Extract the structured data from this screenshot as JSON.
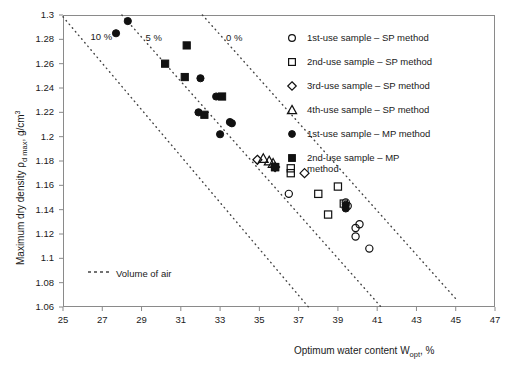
{
  "chart_data": {
    "type": "scatter",
    "title": "",
    "xlabel": "Optimum water content Wopt , %",
    "ylabel": "Maximum dry density ρd max , g/cm3",
    "xlim": [
      25,
      47
    ],
    "ylim": [
      1.06,
      1.3
    ],
    "xticks": [
      25,
      27,
      29,
      31,
      33,
      35,
      37,
      39,
      41,
      43,
      45,
      47
    ],
    "yticks": [
      1.06,
      1.08,
      1.1,
      1.12,
      1.14,
      1.16,
      1.18,
      1.2,
      1.22,
      1.24,
      1.26,
      1.28,
      1.3
    ],
    "grid": false,
    "legend_position": "top-right",
    "series": [
      {
        "name": "1st-use sample – SP method",
        "marker": "open-circle",
        "points": [
          [
            36.5,
            1.153
          ],
          [
            39.4,
            1.146
          ],
          [
            39.5,
            1.143
          ],
          [
            39.9,
            1.125
          ],
          [
            40.1,
            1.128
          ],
          [
            39.9,
            1.118
          ],
          [
            40.6,
            1.108
          ]
        ]
      },
      {
        "name": "2nd-use sample – SP method",
        "marker": "open-square",
        "points": [
          [
            35.8,
            1.175
          ],
          [
            36.6,
            1.174
          ],
          [
            36.6,
            1.17
          ],
          [
            38.0,
            1.153
          ],
          [
            39.0,
            1.159
          ],
          [
            38.5,
            1.136
          ],
          [
            39.3,
            1.145
          ]
        ]
      },
      {
        "name": "3rd-use sample – SP method",
        "marker": "open-diamond",
        "points": [
          [
            34.9,
            1.181
          ],
          [
            37.3,
            1.17
          ],
          [
            35.8,
            1.175
          ]
        ]
      },
      {
        "name": "4th-use sample – SP method",
        "marker": "open-triangle",
        "points": [
          [
            35.2,
            1.182
          ],
          [
            35.5,
            1.18
          ],
          [
            35.7,
            1.178
          ]
        ]
      },
      {
        "name": "1st-use sample – MP method",
        "marker": "filled-circle",
        "points": [
          [
            28.3,
            1.295
          ],
          [
            27.7,
            1.285
          ],
          [
            32.0,
            1.248
          ],
          [
            32.8,
            1.233
          ],
          [
            31.9,
            1.22
          ],
          [
            33.5,
            1.212
          ],
          [
            33.6,
            1.211
          ],
          [
            33.0,
            1.202
          ],
          [
            39.4,
            1.144
          ],
          [
            39.4,
            1.141
          ]
        ]
      },
      {
        "name": "2nd-use sample – MP method",
        "marker": "filled-square",
        "points": [
          [
            31.3,
            1.275
          ],
          [
            30.2,
            1.26
          ],
          [
            31.2,
            1.249
          ],
          [
            33.1,
            1.233
          ],
          [
            32.2,
            1.218
          ],
          [
            35.8,
            1.175
          ]
        ]
      }
    ],
    "airvoid_lines": [
      {
        "label": "10 %",
        "label_x": 26.4,
        "label_y": 1.282,
        "x1": 25.0,
        "y1": 1.2985,
        "x2": 37.5,
        "y2": 1.06
      },
      {
        "label": "5 %",
        "label_x": 29.2,
        "label_y": 1.281,
        "x1": 28.0,
        "y1": 1.3,
        "x2": 41.2,
        "y2": 1.06
      },
      {
        "label": "0 %",
        "label_x": 33.3,
        "label_y": 1.281,
        "x1": 32.1,
        "y1": 1.3,
        "x2": 45.1,
        "y2": 1.065
      }
    ],
    "airvoid_legend": "Volume of air"
  },
  "axes": {
    "y_label_main": "Maximum dry density",
    "y_label_rho": "ρ",
    "y_label_rho_sub": "d max",
    "y_label_unit": ", g/cm",
    "y_label_unit_sup": "3",
    "x_label_main": "Optimum water content W",
    "x_label_sub": "opt",
    "x_label_tail": ", %"
  },
  "legend": {
    "items": [
      {
        "marker": "open-circle",
        "label": "1st-use sample – SP method"
      },
      {
        "marker": "open-square",
        "label": "2nd-use sample – SP method"
      },
      {
        "marker": "open-diamond",
        "label": "3rd-use sample – SP method"
      },
      {
        "marker": "open-triangle",
        "label": "4th-use sample – SP method"
      },
      {
        "marker": "filled-circle",
        "label": "1st-use sample – MP method"
      },
      {
        "marker": "filled-square",
        "label": "2nd-use sample – MP",
        "label2": "method"
      }
    ]
  },
  "colors": {
    "frame": "#8a8a8a",
    "marker": "#111111",
    "dotted": "#444444",
    "text": "#1a1a1a"
  }
}
